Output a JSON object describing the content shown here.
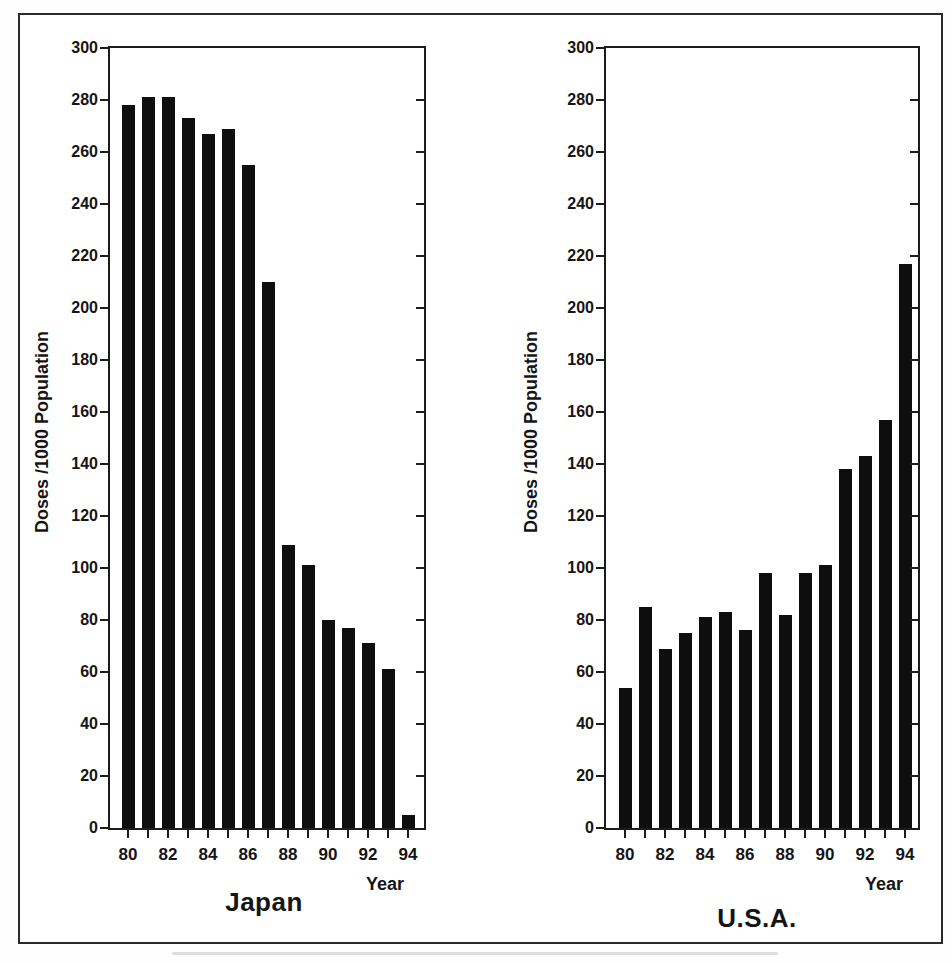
{
  "colors": {
    "bar": "#0e0e0e",
    "frame": "#1d1d1d",
    "background": "#ffffff",
    "text": "#151515"
  },
  "chart_data": [
    {
      "type": "bar",
      "title": "Japan",
      "xlabel": "Year",
      "ylabel": "Doses /1000 Population",
      "ylim": [
        0,
        300
      ],
      "ytick_step": 20,
      "grid": "off",
      "legend": "none",
      "categories": [
        "80",
        "81",
        "82",
        "83",
        "84",
        "85",
        "86",
        "87",
        "88",
        "89",
        "90",
        "91",
        "92",
        "93",
        "94"
      ],
      "xtick_labeled": [
        "80",
        "82",
        "84",
        "86",
        "88",
        "90",
        "92",
        "94"
      ],
      "values": [
        278,
        281,
        281,
        273,
        267,
        269,
        255,
        210,
        109,
        101,
        80,
        77,
        71,
        61,
        5
      ]
    },
    {
      "type": "bar",
      "title": "U.S.A.",
      "xlabel": "Year",
      "ylabel": "Doses /1000 Population",
      "ylim": [
        0,
        300
      ],
      "ytick_step": 20,
      "grid": "off",
      "legend": "none",
      "categories": [
        "80",
        "81",
        "82",
        "83",
        "84",
        "85",
        "86",
        "87",
        "88",
        "89",
        "90",
        "91",
        "92",
        "93",
        "94"
      ],
      "xtick_labeled": [
        "80",
        "82",
        "84",
        "86",
        "88",
        "90",
        "92",
        "94"
      ],
      "values": [
        54,
        85,
        69,
        75,
        81,
        83,
        76,
        98,
        82,
        98,
        101,
        138,
        143,
        157,
        217
      ]
    }
  ]
}
